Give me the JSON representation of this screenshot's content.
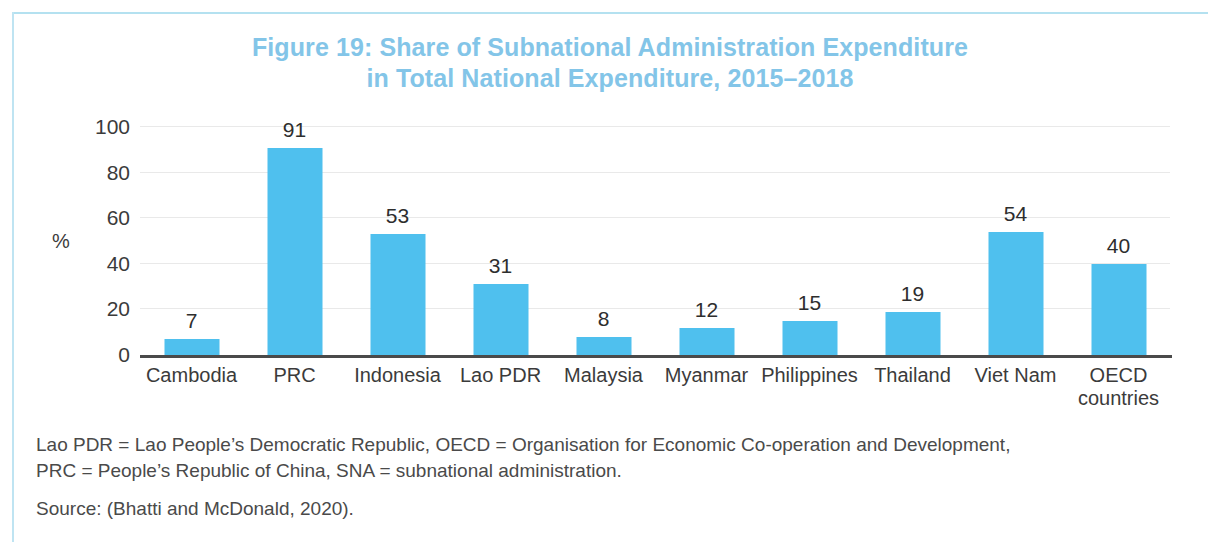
{
  "figure": {
    "title_line1": "Figure 19: Share of Subnational Administration Expenditure",
    "title_line2": "in Total National Expenditure, 2015–2018",
    "title_color": "#83c5e8"
  },
  "notes": {
    "line1": "Lao PDR = Lao People’s Democratic Republic, OECD = Organisation for Economic Co-operation and Development,",
    "line2": "PRC = People’s Republic of China, SNA = subnational administration.",
    "source": "Source: (Bhatti and McDonald, 2020)."
  },
  "chart_data": {
    "type": "bar",
    "title": "Figure 19: Share of Subnational Administration Expenditure in Total National Expenditure, 2015–2018",
    "xlabel": "",
    "ylabel": "%",
    "ylim": [
      0,
      100
    ],
    "yticks": [
      0,
      20,
      40,
      60,
      80,
      100
    ],
    "ytick_labels": [
      "0",
      "20",
      "40",
      "60",
      "80",
      "100"
    ],
    "grid": true,
    "legend": false,
    "bar_color": "#4fc0ee",
    "data_labels": true,
    "categories": [
      "Cambodia",
      "PRC",
      "Indonesia",
      "Lao PDR",
      "Malaysia",
      "Myanmar",
      "Philippines",
      "Thailand",
      "Viet Nam",
      "OECD countries"
    ],
    "category_lines": [
      [
        "Cambodia"
      ],
      [
        "PRC"
      ],
      [
        "Indonesia"
      ],
      [
        "Lao PDR"
      ],
      [
        "Malaysia"
      ],
      [
        "Myanmar"
      ],
      [
        "Philippines"
      ],
      [
        "Thailand"
      ],
      [
        "Viet Nam"
      ],
      [
        "OECD",
        "countries"
      ]
    ],
    "values": [
      7,
      91,
      53,
      31,
      8,
      12,
      15,
      19,
      54,
      40
    ],
    "value_labels": [
      "7",
      "91",
      "53",
      "31",
      "8",
      "12",
      "15",
      "19",
      "54",
      "40"
    ]
  }
}
